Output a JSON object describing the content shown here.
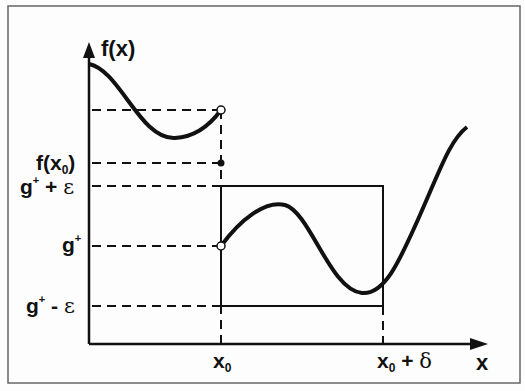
{
  "diagram": {
    "y_axis_label": "f(x)",
    "x_axis_label": "x",
    "x_ticks": {
      "x0": {
        "base": "x",
        "sub": "0"
      },
      "x0_plus_delta": {
        "base": "x",
        "sub": "0",
        "suffix": " + ",
        "sym": "δ"
      }
    },
    "y_labels": {
      "f_x0": {
        "pre": "f(x",
        "sub": "0",
        "post": ")"
      },
      "g_plus_eps": {
        "base": "g",
        "sup": "+",
        "op": " + ",
        "sym": "ε"
      },
      "g_plus": {
        "base": "g",
        "sup": "+"
      },
      "g_minus_eps": {
        "base": "g",
        "sup": "+",
        "op": " - ",
        "sym": "ε"
      }
    },
    "colors": {
      "ink": "#111111",
      "background": "#fdfdfd",
      "frame": "#555555"
    }
  }
}
